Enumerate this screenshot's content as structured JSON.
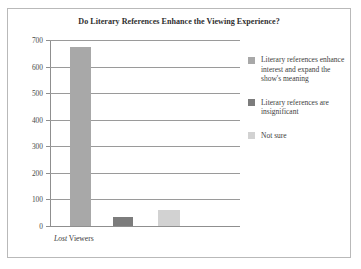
{
  "chart_data": {
    "type": "bar",
    "title": "Do Literary References Enhance the Viewing Experience?",
    "xlabel": "Lost Viewers",
    "xlabel_italic_part": "Lost",
    "xlabel_plain_part": "Viewers",
    "ylabel": "",
    "ylim": [
      0,
      700
    ],
    "ytick_step": 100,
    "yticks": [
      700,
      600,
      500,
      400,
      300,
      200,
      100,
      0
    ],
    "grid": true,
    "legend_position": "right",
    "categories": [
      "Literary references enhance interest and expand the show's meaning",
      "Literary references are insignificant",
      "Not sure"
    ],
    "values": [
      675,
      35,
      62
    ],
    "colors": [
      "#a8a8a8",
      "#7c7c7c",
      "#d2d2d2"
    ],
    "series": [
      {
        "name": "Lost Viewers",
        "values": [
          675,
          35,
          62
        ]
      }
    ]
  },
  "legend": {
    "items": [
      {
        "label": "Literary references enhance interest and expand the show's meaning",
        "color": "#a8a8a8"
      },
      {
        "label": "Literary references are insignificant",
        "color": "#7c7c7c"
      },
      {
        "label": "Not sure",
        "color": "#d2d2d2"
      }
    ]
  },
  "axis": {
    "yticks": [
      "700",
      "600",
      "500",
      "400",
      "300",
      "200",
      "100",
      "0"
    ]
  },
  "figure": {
    "border_color": "#b9b9b9",
    "background": "#ffffff"
  }
}
